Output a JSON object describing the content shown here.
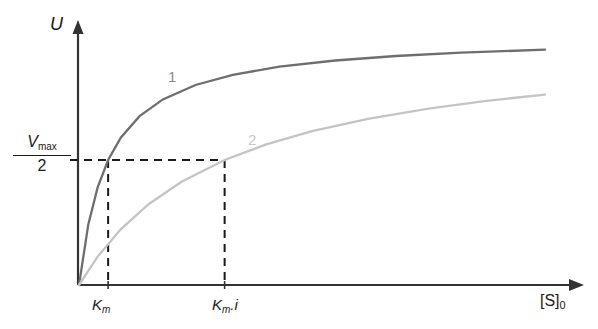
{
  "figure": {
    "background_color": "#ffffff",
    "axis_color": "#333333"
  },
  "axes": {
    "y_label": "U",
    "x_label_main": "[S]",
    "x_label_sub": "0",
    "y_tick": {
      "numerator_symbol": "V",
      "numerator_subscript": "max",
      "denominator": "2"
    },
    "x_ticks": [
      {
        "id": "km",
        "symbol": "K",
        "subscript": "m",
        "suffix": ""
      },
      {
        "id": "kmi",
        "symbol": "K",
        "subscript": "m",
        "suffix": ".i"
      }
    ]
  },
  "curves": [
    {
      "label": "1",
      "color": "#6e6e6e",
      "label_color": "#8a8a8a"
    },
    {
      "label": "2",
      "color": "#c4c4c4",
      "label_color": "#c9c9c9"
    }
  ],
  "chart_data": {
    "type": "line",
    "title": "",
    "xlabel": "[S]0",
    "ylabel": "U",
    "grid": false,
    "legend": "inline-curve-labels",
    "xlim": [
      0,
      1
    ],
    "ylim": [
      0,
      1
    ],
    "axis_ticks": {
      "x": [
        "Km",
        "Km.i"
      ],
      "y": [
        "Vmax/2"
      ]
    },
    "annotations": [
      "Horizontal dashed line at y = Vmax/2 from the U axis to the intersection with curve 2",
      "Vertical dashed line from x = Km down to the [S]0 axis (curve 1 half-saturation)",
      "Vertical dashed line from x = Km.i down to the [S]0 axis (curve 2 half-saturation)"
    ],
    "series": [
      {
        "name": "1",
        "description": "Michaelis-Menten hyperbola without inhibitor; half-maximal velocity at Km",
        "model": "v = Vmax * S / (Km + S)",
        "Km_relative": 0.0625,
        "color": "#6e6e6e",
        "x": [
          0.0,
          0.02,
          0.04,
          0.0625,
          0.09,
          0.13,
          0.18,
          0.25,
          0.33,
          0.43,
          0.55,
          0.68,
          0.82,
          1.0
        ],
        "y": [
          0.0,
          0.2424,
          0.3902,
          0.5,
          0.5902,
          0.6753,
          0.7423,
          0.8,
          0.8408,
          0.8731,
          0.898,
          0.9159,
          0.9292,
          0.9412
        ]
      },
      {
        "name": "2",
        "description": "Michaelis-Menten hyperbola with competitive inhibitor; half-maximal velocity at Km.i",
        "model": "v = Vmax * S / (Km*i + S)",
        "Km_relative": 0.3125,
        "color": "#c4c4c4",
        "x": [
          0.0,
          0.04,
          0.09,
          0.15,
          0.22,
          0.3125,
          0.4,
          0.5,
          0.62,
          0.75,
          0.87,
          1.0
        ],
        "y": [
          0.0,
          0.1135,
          0.2235,
          0.3243,
          0.4132,
          0.5,
          0.5614,
          0.6154,
          0.6649,
          0.7059,
          0.7358,
          0.7619
        ]
      }
    ],
    "reference_lines": [
      {
        "orientation": "horizontal",
        "y": 0.5,
        "style": "dashed",
        "color": "#1a1a1a"
      },
      {
        "orientation": "vertical",
        "x": 0.0625,
        "style": "dashed",
        "color": "#1a1a1a"
      },
      {
        "orientation": "vertical",
        "x": 0.3125,
        "style": "dashed",
        "color": "#1a1a1a"
      }
    ]
  }
}
